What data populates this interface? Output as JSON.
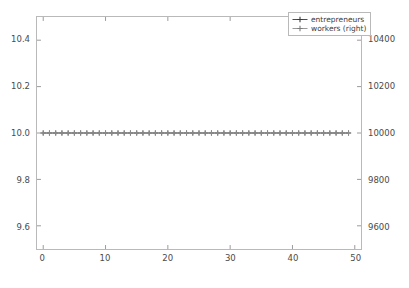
{
  "chart_data": {
    "type": "line",
    "title": "",
    "xlabel": "",
    "ylabel": "",
    "ylabel_right": "",
    "grid": false,
    "legend_position": "upper right",
    "xlim": [
      -1.0,
      51.0
    ],
    "ylim": [
      9.5,
      10.5
    ],
    "ylim_right": [
      9500,
      10500
    ],
    "xticks": [
      0,
      10,
      20,
      30,
      40,
      50
    ],
    "xticklabels": [
      "0",
      "10",
      "20",
      "30",
      "40",
      "50"
    ],
    "yticks": [
      9.6,
      9.8,
      10.0,
      10.2,
      10.4
    ],
    "yticklabels": [
      "9.6",
      "9.8",
      "10.0",
      "10.2",
      "10.4"
    ],
    "yticks_right": [
      9600,
      9800,
      10000,
      10200,
      10400
    ],
    "yticklabels_right": [
      "9600",
      "9800",
      "10000",
      "10200",
      "10400"
    ],
    "x": [
      0,
      1,
      2,
      3,
      4,
      5,
      6,
      7,
      8,
      9,
      10,
      11,
      12,
      13,
      14,
      15,
      16,
      17,
      18,
      19,
      20,
      21,
      22,
      23,
      24,
      25,
      26,
      27,
      28,
      29,
      30,
      31,
      32,
      33,
      34,
      35,
      36,
      37,
      38,
      39,
      40,
      41,
      42,
      43,
      44,
      45,
      46,
      47,
      48,
      49
    ],
    "series": [
      {
        "name": "entrepreneurs",
        "axis": "left",
        "color": "#4d4d4d",
        "marker": "plus",
        "values": [
          10,
          10,
          10,
          10,
          10,
          10,
          10,
          10,
          10,
          10,
          10,
          10,
          10,
          10,
          10,
          10,
          10,
          10,
          10,
          10,
          10,
          10,
          10,
          10,
          10,
          10,
          10,
          10,
          10,
          10,
          10,
          10,
          10,
          10,
          10,
          10,
          10,
          10,
          10,
          10,
          10,
          10,
          10,
          10,
          10,
          10,
          10,
          10,
          10,
          10
        ]
      },
      {
        "name": "workers (right)",
        "axis": "right",
        "color": "#8c8c8c",
        "marker": "plus",
        "values": [
          10000,
          10000,
          10000,
          10000,
          10000,
          10000,
          10000,
          10000,
          10000,
          10000,
          10000,
          10000,
          10000,
          10000,
          10000,
          10000,
          10000,
          10000,
          10000,
          10000,
          10000,
          10000,
          10000,
          10000,
          10000,
          10000,
          10000,
          10000,
          10000,
          10000,
          10000,
          10000,
          10000,
          10000,
          10000,
          10000,
          10000,
          10000,
          10000,
          10000,
          10000,
          10000,
          10000,
          10000,
          10000,
          10000,
          10000,
          10000,
          10000,
          10000
        ]
      }
    ]
  },
  "legend": {
    "entries": [
      {
        "label": "entrepreneurs"
      },
      {
        "label": "workers (right)"
      }
    ]
  },
  "axes": {
    "frame_color": "#b9b9b9",
    "tick_color": "#9a9a9a",
    "label_color": "#4a4a4a",
    "background": "#ffffff"
  }
}
